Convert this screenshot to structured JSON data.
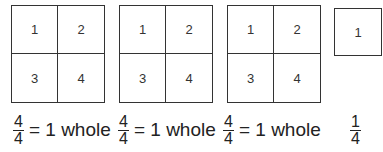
{
  "grids": [
    {
      "cells": [
        "1",
        "2",
        "3",
        "4"
      ]
    },
    {
      "cells": [
        "1",
        "2",
        "3",
        "4"
      ]
    },
    {
      "cells": [
        "1",
        "2",
        "3",
        "4"
      ]
    }
  ],
  "single": {
    "cell": "1"
  },
  "equations": [
    {
      "numerator": "4",
      "denominator": "4",
      "text": "= 1 whole"
    },
    {
      "numerator": "4",
      "denominator": "4",
      "text": "= 1 whole"
    },
    {
      "numerator": "4",
      "denominator": "4",
      "text": "= 1 whole"
    },
    {
      "numerator": "1",
      "denominator": "4",
      "text": ""
    }
  ]
}
